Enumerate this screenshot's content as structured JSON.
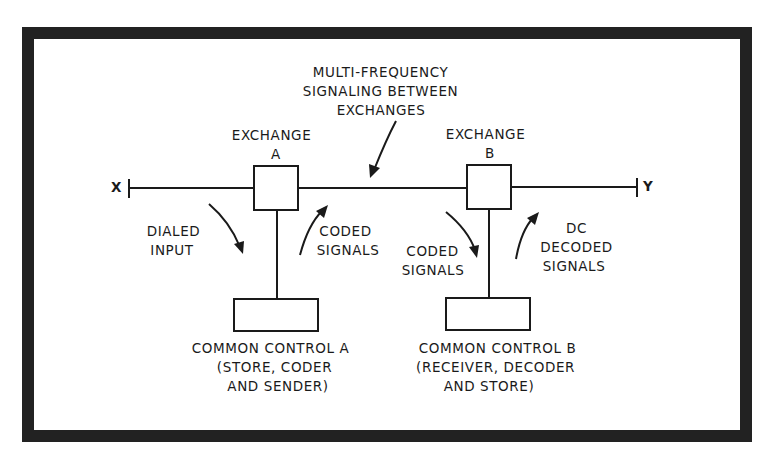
{
  "colors": {
    "ink": "#1a1a1a",
    "frame": "#222222",
    "background": "#ffffff"
  },
  "diagram": {
    "title_annotation": {
      "lines": [
        "MULTI-FREQUENCY",
        "SIGNALING BETWEEN",
        "EXCHANGES"
      ]
    },
    "endpoints": {
      "left": "X",
      "right": "Y"
    },
    "exchange_a": {
      "lines": [
        "EXCHANGE",
        "A"
      ]
    },
    "exchange_b": {
      "lines": [
        "EXCHANGE",
        "B"
      ]
    },
    "signal_labels": {
      "dialed_input": [
        "DIALED",
        "INPUT"
      ],
      "coded_signals_a": [
        "CODED",
        "SIGNALS"
      ],
      "coded_signals_b": [
        "CODED",
        "SIGNALS"
      ],
      "dc_decoded_signals": [
        "DC",
        "DECODED",
        "SIGNALS"
      ]
    },
    "common_control_a": {
      "lines": [
        "COMMON CONTROL A",
        "(STORE, CODER",
        "AND SENDER)"
      ]
    },
    "common_control_b": {
      "lines": [
        "COMMON CONTROL B",
        "(RECEIVER, DECODER",
        "AND STORE)"
      ]
    }
  }
}
